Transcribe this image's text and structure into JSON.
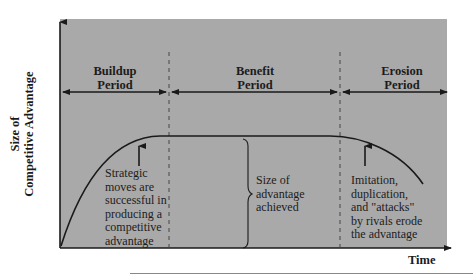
{
  "diagram": {
    "title": "",
    "y_axis_label_line1": "Size of",
    "y_axis_label_line2": "Competitive Advantage",
    "x_axis_label": "Time",
    "periods": [
      {
        "line1": "Buildup",
        "line2": "Period"
      },
      {
        "line1": "Benefit",
        "line2": "Period"
      },
      {
        "line1": "Erosion",
        "line2": "Period"
      }
    ],
    "annotations": {
      "buildup": [
        "Strategic",
        "moves are",
        "successful in",
        "producing a",
        "competitive",
        "advantage"
      ],
      "benefit": [
        "Size of",
        "advantage",
        "achieved"
      ],
      "erosion": [
        "Imitation,",
        "duplication,",
        "and \"attacks\"",
        "by rivals erode",
        "the advantage"
      ]
    },
    "colors": {
      "panel_background": "#a9a9a9",
      "page_background": "#ffffff",
      "line": "#1a1a1a"
    }
  }
}
